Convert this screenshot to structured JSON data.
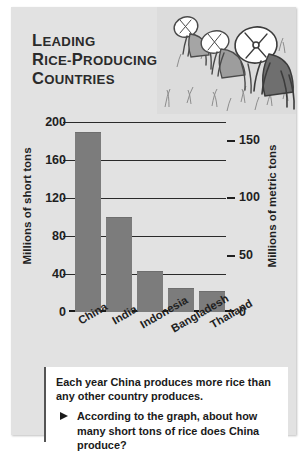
{
  "card": {
    "title_lines": [
      {
        "big": "L",
        "rest": "EADING"
      },
      {
        "big": "R",
        "rest": "ICE-P",
        "big2": "",
        "rest2": "RODUCING"
      },
      {
        "big": "C",
        "rest": "OUNTRIES"
      }
    ],
    "title_plain": "Leading Rice-Producing Countries"
  },
  "illustration": {
    "name": "rice-farmers-illustration",
    "description": "Three farmers in conical hats bending over in a rice paddy"
  },
  "chart_data": {
    "type": "bar",
    "title": "Leading Rice-Producing Countries",
    "categories": [
      "China",
      "India",
      "Indonesia",
      "Bangladesh",
      "Thailand"
    ],
    "values": [
      188,
      99,
      42,
      24,
      21
    ],
    "xlabel": "",
    "ylabel": "Millions of short tons",
    "ylabel_right": "Millions of metric tons",
    "ylim": [
      0,
      200
    ],
    "yticks": [
      0,
      40,
      80,
      120,
      160,
      200
    ],
    "ytick_labels": [
      "0",
      "40",
      "80",
      "120",
      "160",
      "200"
    ],
    "ylim_right": [
      0,
      181
    ],
    "yticks_right": [
      0,
      50,
      100,
      150
    ],
    "ytick_labels_right": [
      "0",
      "50",
      "100",
      "150"
    ],
    "grid": true,
    "legend": "none",
    "bar_color": "#7c7c7c"
  },
  "callout": {
    "lead": "Each year China produces more rice than any other country produces.",
    "bullet_icon": "triangle-right-icon",
    "question": "According to the graph, about how many short tons of rice does China produce?"
  }
}
